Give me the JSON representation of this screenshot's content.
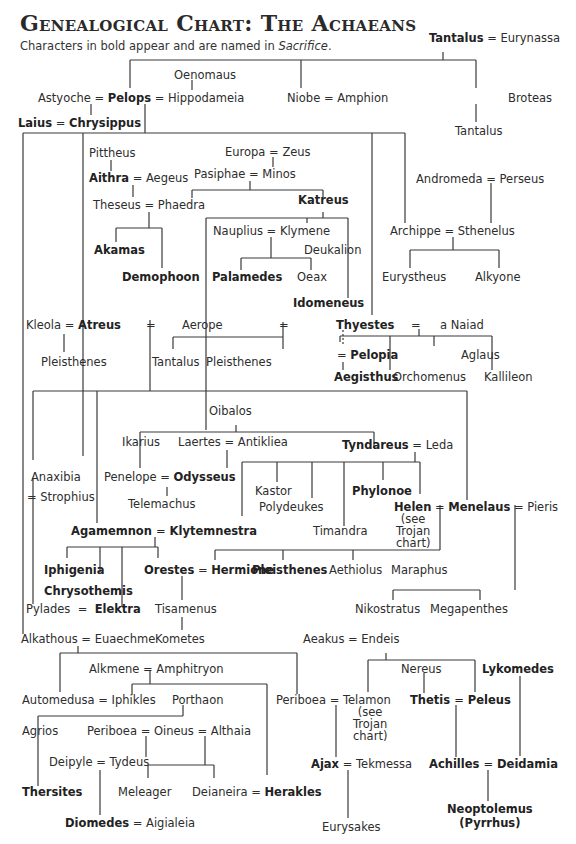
{
  "header": {
    "title": "Genealogical Chart: The Achaeans",
    "subtitle_prefix": "Characters in bold appear and are named in ",
    "subtitle_work": "Sacrifice",
    "subtitle_suffix": "."
  },
  "eq": "=",
  "names": {
    "tantalus": "Tantalus",
    "eurynassa": "Eurynassa",
    "oenomaus": "Oenomaus",
    "astyoche": "Astyoche",
    "pelops": "Pelops",
    "hippodameia": "Hippodameia",
    "niobe": "Niobe",
    "amphion": "Amphion",
    "broteas": "Broteas",
    "tantalus2": "Tantalus",
    "laius": "Laius",
    "chrysippus": "Chrysippus",
    "pittheus": "Pittheus",
    "aithra": "Aithra",
    "aegeus": "Aegeus",
    "theseus": "Theseus",
    "phaedra": "Phaedra",
    "akamas": "Akamas",
    "demophoon": "Demophoon",
    "europa": "Europa",
    "zeus": "Zeus",
    "pasiphae": "Pasiphae",
    "minos": "Minos",
    "katreus": "Katreus",
    "nauplius": "Nauplius",
    "klymene": "Klymene",
    "deukalion": "Deukalion",
    "palamedes": "Palamedes",
    "oeax": "Oeax",
    "idomeneus": "Idomeneus",
    "andromeda": "Andromeda",
    "perseus": "Perseus",
    "archippe": "Archippe",
    "sthenelus": "Sthenelus",
    "eurystheus": "Eurystheus",
    "alkyone": "Alkyone",
    "kleola": "Kleola",
    "atreus": "Atreus",
    "aerope": "Aerope",
    "pleisthenes1": "Pleisthenes",
    "tantalus3": "Tantalus",
    "pleisthenes2": "Pleisthenes",
    "thyestes": "Thyestes",
    "naiad": "a Naiad",
    "pelopia": "Pelopia",
    "aglaus": "Aglaus",
    "aegisthus": "Aegisthus",
    "orchomenus": "Orchomenus",
    "kallileon": "Kallileon",
    "oibalos": "Oibalos",
    "ikarius": "Ikarius",
    "laertes": "Laertes",
    "antikleia": "Antikliea",
    "tyndareus": "Tyndareus",
    "leda": "Leda",
    "anaxibia": "Anaxibia",
    "strophius": "Strophius",
    "penelope": "Penelope",
    "odysseus": "Odysseus",
    "telemachus": "Telemachus",
    "kastor": "Kastor",
    "polydeukes": "Polydeukes",
    "phylonoe": "Phylonoe",
    "helen": "Helen",
    "menelaus": "Menelaus",
    "pieris": "Pieris",
    "timandra": "Timandra",
    "see_trojan": "(see\nTrojan\nchart)",
    "agamemnon": "Agamemnon",
    "klytemnestra": "Klytemnestra",
    "iphigenia": "Iphigenia",
    "chrysothemis": "Chrysothemis",
    "orestes": "Orestes",
    "hermione": "Hermione",
    "pleisthenes3": "Pleisthenes",
    "aethiolus": "Aethiolus",
    "maraphus": "Maraphus",
    "pylades": "Pylades",
    "elektra": "Elektra",
    "tisamenus": "Tisamenus",
    "nikostratus": "Nikostratus",
    "megapenthes": "Megapenthes",
    "alkathous": "Alkathous",
    "euaechme": "Euaechme",
    "kometes": "Kometes",
    "aeakus": "Aeakus",
    "endeis": "Endeis",
    "alkmene": "Alkmene",
    "amphitryon": "Amphitryon",
    "automedusa": "Automedusa",
    "iphikles": "Iphikles",
    "porthaon": "Porthaon",
    "nereus": "Nereus",
    "lykomedes": "Lykomedes",
    "periboea1": "Periboea",
    "telamon": "Telamon",
    "thetis": "Thetis",
    "peleus": "Peleus",
    "agrios": "Agrios",
    "periboea2": "Periboea",
    "oineus": "Oineus",
    "althaia": "Althaia",
    "deipyle": "Deipyle",
    "tydeus": "Tydeus",
    "ajax": "Ajax",
    "tekmessa": "Tekmessa",
    "achilles": "Achilles",
    "deidamia": "Deidamia",
    "thersites": "Thersites",
    "meleager": "Meleager",
    "deianeira": "Deianeira",
    "herakles": "Herakles",
    "diomedes": "Diomedes",
    "aigialeia": "Aigialeia",
    "eurysakes": "Eurysakes",
    "neoptolemus": "Neoptolemus",
    "pyrrhus": "(Pyrrhus)"
  }
}
